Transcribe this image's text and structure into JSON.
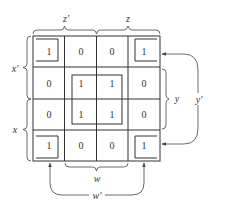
{
  "diagram": {
    "type": "karnaugh-map",
    "grid": {
      "rows": [
        [
          "1",
          "0",
          "0",
          "1"
        ],
        [
          "0",
          "1",
          "1",
          "0"
        ],
        [
          "0",
          "1",
          "1",
          "0"
        ],
        [
          "1",
          "0",
          "0",
          "1"
        ]
      ]
    },
    "labels": {
      "top_left": "z'",
      "top_right": "z",
      "left_top": "x'",
      "left_bottom": "x",
      "right_inner": "y",
      "right_outer": "y'",
      "bottom_inner": "w",
      "bottom_outer": "w'"
    },
    "groups": [
      {
        "name": "center-quad",
        "cells": "rows 2-3, cols 2-3"
      },
      {
        "name": "corner-quad",
        "cells": "four corners"
      }
    ],
    "colors": {
      "line": "#333333",
      "background": "#ffffff"
    }
  }
}
